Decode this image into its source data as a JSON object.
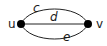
{
  "graph": {
    "vertices": [
      {
        "id": "u",
        "label": "u"
      },
      {
        "id": "v",
        "label": "v"
      }
    ],
    "edges": [
      {
        "id": "c",
        "label": "c",
        "from": "u",
        "to": "v",
        "shape": "upper-arc"
      },
      {
        "id": "d",
        "label": "d",
        "from": "u",
        "to": "v",
        "shape": "straight"
      },
      {
        "id": "e",
        "label": "e",
        "from": "u",
        "to": "v",
        "shape": "lower-arc"
      }
    ]
  },
  "colors": {
    "stroke": "#1a1a1a",
    "vertex_fill": "#000000"
  }
}
